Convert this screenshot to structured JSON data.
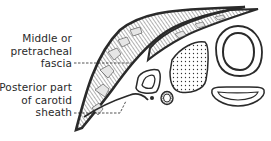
{
  "diagram": {
    "type": "anatomical cross-section",
    "labels": [
      {
        "id": "middle-fascia",
        "lines": [
          "Middle or",
          "pretracheal",
          "fascia"
        ]
      },
      {
        "id": "carotid-sheath",
        "lines": [
          "Posterior part",
          "of carotid",
          "sheath"
        ]
      }
    ],
    "structures": [
      "outer fascial layer (hatched muscle band)",
      "inner fascial layer (hatched band)",
      "posterior carotid sheath line",
      "small triangular structure (vessel)",
      "small dot (nerve)",
      "small ring (vessel)",
      "stippled thyroid lobe",
      "trachea (double-ring)",
      "esophagus (crescent)"
    ],
    "colors": {
      "line": "#2a2a2a",
      "background": "#ffffff"
    }
  }
}
